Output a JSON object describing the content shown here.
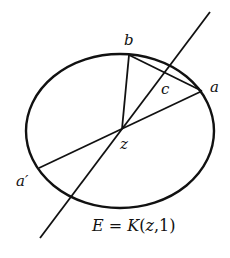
{
  "diagram": {
    "type": "geometry",
    "stroke_color": "#111111",
    "background": "#ffffff",
    "ellipse": {
      "cx": 120,
      "cy": 131,
      "rx": 94,
      "ry": 77,
      "stroke_width": 2.4
    },
    "points": {
      "z": {
        "x": 122,
        "y": 129
      },
      "b": {
        "x": 129,
        "y": 55
      },
      "a": {
        "x": 202,
        "y": 91
      },
      "a_prime": {
        "x": 39,
        "y": 168
      }
    },
    "line": {
      "x1": 210,
      "y1": 12,
      "x2": 40,
      "y2": 238
    },
    "labels": {
      "b": "b",
      "a": "a",
      "c": "c",
      "z": "z",
      "a_prime": "a′",
      "equation": "E = K(z,1)"
    }
  }
}
